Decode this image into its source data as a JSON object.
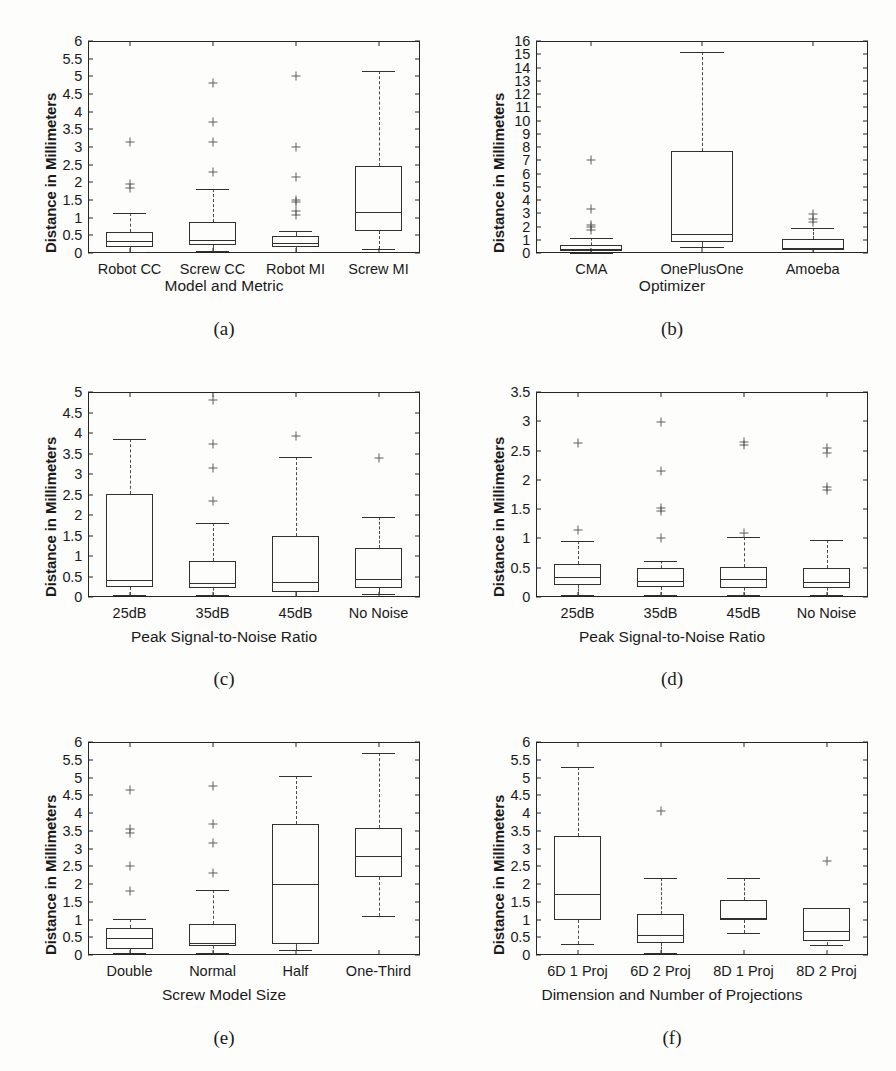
{
  "figure": {
    "background": "#fdfdfb",
    "line_color": "#303030",
    "panel_count": 6,
    "shared_ylabel": "Distance in Millimeters"
  },
  "panels": [
    {
      "key": "a",
      "subcaption": "(a)",
      "ylabel": "Distance in Millimeters",
      "xlabel": "Model and Metric"
    },
    {
      "key": "b",
      "subcaption": "(b)",
      "ylabel": "Distance in Millimeters",
      "xlabel": "Optimizer"
    },
    {
      "key": "c",
      "subcaption": "(c)",
      "ylabel": "Distance in Millimeters",
      "xlabel": "Peak Signal-to-Noise Ratio"
    },
    {
      "key": "d",
      "subcaption": "(d)",
      "ylabel": "Distance in Millimeters",
      "xlabel": "Peak Signal-to-Noise Ratio"
    },
    {
      "key": "e",
      "subcaption": "(e)",
      "ylabel": "Distance in Millimeters",
      "xlabel": "Screw Model Size"
    },
    {
      "key": "f",
      "subcaption": "(f)",
      "ylabel": "Distance in Millimeters",
      "xlabel": "Dimension and Number of Projections"
    }
  ],
  "chart_data": [
    {
      "panel": "a",
      "type": "box",
      "title": "",
      "subcaption": "(a)",
      "xlabel": "Model and Metric",
      "ylabel": "Distance in Millimeters",
      "ylim": [
        0,
        6
      ],
      "yticks": [
        0,
        0.5,
        1,
        1.5,
        2,
        2.5,
        3,
        3.5,
        4,
        4.5,
        5,
        5.5,
        6
      ],
      "ytick_labels": [
        "0",
        "0.5",
        "1",
        "1.5",
        "2",
        "2.5",
        "3",
        "3.5",
        "4",
        "4.5",
        "5",
        "5.5",
        "6"
      ],
      "grid": false,
      "categories": [
        "Robot CC",
        "Screw CC",
        "Robot MI",
        "Screw MI"
      ],
      "boxes": [
        {
          "category": "Robot CC",
          "whisker_low": 0.03,
          "q1": 0.17,
          "median": 0.33,
          "q3": 0.6,
          "whisker_high": 1.12,
          "outliers": [
            1.85,
            1.95,
            3.15
          ]
        },
        {
          "category": "Screw CC",
          "whisker_low": 0.07,
          "q1": 0.24,
          "median": 0.38,
          "q3": 0.88,
          "whisker_high": 1.82,
          "outliers": [
            2.3,
            3.15,
            3.72,
            4.8
          ]
        },
        {
          "category": "Robot MI",
          "whisker_low": 0.03,
          "q1": 0.16,
          "median": 0.28,
          "q3": 0.47,
          "whisker_high": 0.63,
          "outliers": [
            1.08,
            1.2,
            1.45,
            1.5,
            2.15,
            3.0,
            5.0
          ]
        },
        {
          "category": "Screw MI",
          "whisker_low": 0.12,
          "q1": 0.62,
          "median": 1.17,
          "q3": 2.46,
          "whisker_high": 5.15,
          "outliers": []
        }
      ]
    },
    {
      "panel": "b",
      "type": "box",
      "title": "",
      "subcaption": "(b)",
      "xlabel": "Optimizer",
      "ylabel": "Distance in Millimeters",
      "ylim": [
        0,
        16
      ],
      "yticks": [
        0,
        1,
        2,
        3,
        4,
        5,
        6,
        7,
        8,
        9,
        10,
        11,
        12,
        13,
        14,
        15,
        16
      ],
      "ytick_labels": [
        "0",
        "1",
        "2",
        "3",
        "4",
        "5",
        "6",
        "7",
        "8",
        "9",
        "10",
        "11",
        "12",
        "13",
        "14",
        "15",
        "16"
      ],
      "grid": false,
      "categories": [
        "CMA",
        "OnePlusOne",
        "Amoeba"
      ],
      "boxes": [
        {
          "category": "CMA",
          "whisker_low": 0.03,
          "q1": 0.17,
          "median": 0.33,
          "q3": 0.6,
          "whisker_high": 1.15,
          "outliers": [
            1.75,
            1.95,
            2.1,
            3.35,
            7.0
          ]
        },
        {
          "category": "OnePlusOne",
          "whisker_low": 0.45,
          "q1": 0.85,
          "median": 1.45,
          "q3": 7.7,
          "whisker_high": 15.2,
          "outliers": []
        },
        {
          "category": "Amoeba",
          "whisker_low": 0.05,
          "q1": 0.2,
          "median": 0.4,
          "q3": 1.05,
          "whisker_high": 1.9,
          "outliers": [
            2.35,
            2.6,
            2.95
          ]
        }
      ]
    },
    {
      "panel": "c",
      "type": "box",
      "title": "",
      "subcaption": "(c)",
      "xlabel": "Peak Signal-to-Noise Ratio",
      "ylabel": "Distance in Millimeters",
      "ylim": [
        0,
        5
      ],
      "yticks": [
        0,
        0.5,
        1,
        1.5,
        2,
        2.5,
        3,
        3.5,
        4,
        4.5,
        5
      ],
      "ytick_labels": [
        "0",
        "0.5",
        "1",
        "1.5",
        "2",
        "2.5",
        "3",
        "3.5",
        "4",
        "4.5",
        "5"
      ],
      "grid": false,
      "categories": [
        "25dB",
        "35dB",
        "45dB",
        "No Noise"
      ],
      "boxes": [
        {
          "category": "25dB",
          "whisker_low": 0.05,
          "q1": 0.24,
          "median": 0.42,
          "q3": 2.52,
          "whisker_high": 3.85,
          "outliers": []
        },
        {
          "category": "35dB",
          "whisker_low": 0.05,
          "q1": 0.22,
          "median": 0.35,
          "q3": 0.88,
          "whisker_high": 1.8,
          "outliers": [
            2.35,
            3.15,
            3.72,
            4.8
          ]
        },
        {
          "category": "45dB",
          "whisker_low": 0.02,
          "q1": 0.12,
          "median": 0.37,
          "q3": 1.48,
          "whisker_high": 3.42,
          "outliers": [
            3.92
          ]
        },
        {
          "category": "No Noise",
          "whisker_low": 0.08,
          "q1": 0.23,
          "median": 0.45,
          "q3": 1.2,
          "whisker_high": 1.95,
          "outliers": [
            3.4
          ]
        }
      ]
    },
    {
      "panel": "d",
      "type": "box",
      "title": "",
      "subcaption": "(d)",
      "xlabel": "Peak Signal-to-Noise Ratio",
      "ylabel": "Distance in Millimeters",
      "ylim": [
        0,
        3.5
      ],
      "yticks": [
        0,
        0.5,
        1,
        1.5,
        2,
        2.5,
        3,
        3.5
      ],
      "ytick_labels": [
        "0",
        "0.5",
        "1",
        "1.5",
        "2",
        "2.5",
        "3",
        "3.5"
      ],
      "grid": false,
      "categories": [
        "25dB",
        "35dB",
        "45dB",
        "No Noise"
      ],
      "boxes": [
        {
          "category": "25dB",
          "whisker_low": 0.04,
          "q1": 0.21,
          "median": 0.35,
          "q3": 0.56,
          "whisker_high": 0.95,
          "outliers": [
            1.14,
            2.63
          ]
        },
        {
          "category": "35dB",
          "whisker_low": 0.04,
          "q1": 0.17,
          "median": 0.28,
          "q3": 0.49,
          "whisker_high": 0.62,
          "outliers": [
            1.0,
            1.46,
            1.52,
            2.15,
            2.98
          ]
        },
        {
          "category": "45dB",
          "whisker_low": 0.03,
          "q1": 0.15,
          "median": 0.3,
          "q3": 0.52,
          "whisker_high": 1.02,
          "outliers": [
            1.1,
            2.6,
            2.65
          ]
        },
        {
          "category": "No Noise",
          "whisker_low": 0.04,
          "q1": 0.15,
          "median": 0.25,
          "q3": 0.5,
          "whisker_high": 0.98,
          "outliers": [
            1.82,
            1.88,
            2.46,
            2.54
          ]
        }
      ]
    },
    {
      "panel": "e",
      "type": "box",
      "title": "",
      "subcaption": "(e)",
      "xlabel": "Screw Model Size",
      "ylabel": "Distance in Millimeters",
      "ylim": [
        0,
        6
      ],
      "yticks": [
        0,
        0.5,
        1,
        1.5,
        2,
        2.5,
        3,
        3.5,
        4,
        4.5,
        5,
        5.5,
        6
      ],
      "ytick_labels": [
        "0",
        "0.5",
        "1",
        "1.5",
        "2",
        "2.5",
        "3",
        "3.5",
        "4",
        "4.5",
        "5",
        "5.5",
        "6"
      ],
      "grid": false,
      "categories": [
        "Double",
        "Normal",
        "Half",
        "One-Third"
      ],
      "boxes": [
        {
          "category": "Double",
          "whisker_low": 0.05,
          "q1": 0.17,
          "median": 0.48,
          "q3": 0.75,
          "whisker_high": 1.02,
          "outliers": [
            1.8,
            2.5,
            3.45,
            3.55,
            4.65
          ]
        },
        {
          "category": "Normal",
          "whisker_low": 0.05,
          "q1": 0.25,
          "median": 0.35,
          "q3": 0.88,
          "whisker_high": 1.82,
          "outliers": [
            2.3,
            3.15,
            3.7,
            4.75
          ]
        },
        {
          "category": "Half",
          "whisker_low": 0.15,
          "q1": 0.3,
          "median": 2.0,
          "q3": 3.7,
          "whisker_high": 5.05,
          "outliers": []
        },
        {
          "category": "One-Third",
          "whisker_low": 1.1,
          "q1": 2.2,
          "median": 2.8,
          "q3": 3.58,
          "whisker_high": 5.68,
          "outliers": []
        }
      ]
    },
    {
      "panel": "f",
      "type": "box",
      "title": "",
      "subcaption": "(f)",
      "xlabel": "Dimension and Number of Projections",
      "ylabel": "Distance in Millimeters",
      "ylim": [
        0,
        6
      ],
      "yticks": [
        0,
        0.5,
        1,
        1.5,
        2,
        2.5,
        3,
        3.5,
        4,
        4.5,
        5,
        5.5,
        6
      ],
      "ytick_labels": [
        "0",
        "0.5",
        "1",
        "1.5",
        "2",
        "2.5",
        "3",
        "3.5",
        "4",
        "4.5",
        "5",
        "5.5",
        "6"
      ],
      "grid": false,
      "categories": [
        "6D 1 Proj",
        "6D 2 Proj",
        "8D 1 Proj",
        "8D 2 Proj"
      ],
      "boxes": [
        {
          "category": "6D 1 Proj",
          "whisker_low": 0.32,
          "q1": 0.98,
          "median": 1.72,
          "q3": 3.35,
          "whisker_high": 5.3,
          "outliers": []
        },
        {
          "category": "6D 2 Proj",
          "whisker_low": 0.05,
          "q1": 0.35,
          "median": 0.55,
          "q3": 1.15,
          "whisker_high": 2.18,
          "outliers": [
            4.05
          ]
        },
        {
          "category": "8D 1 Proj",
          "whisker_low": 0.62,
          "q1": 0.98,
          "median": 1.03,
          "q3": 1.55,
          "whisker_high": 2.18,
          "outliers": []
        },
        {
          "category": "8D 2 Proj",
          "whisker_low": 0.28,
          "q1": 0.38,
          "median": 0.68,
          "q3": 1.32,
          "whisker_high": 1.32,
          "outliers": [
            2.65
          ]
        }
      ]
    }
  ]
}
